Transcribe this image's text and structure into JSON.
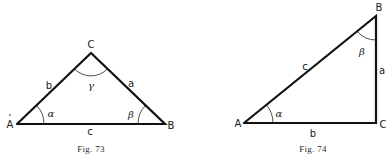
{
  "figures": [
    {
      "caption": "Fig. 73",
      "type": "oblique-triangle",
      "vertices": {
        "A": "A",
        "B": "B",
        "C": "C"
      },
      "sides": {
        "a": "a",
        "b": "b",
        "c": "c"
      },
      "angles": {
        "alpha": "α",
        "beta": "β",
        "gamma": "γ"
      }
    },
    {
      "caption": "Fig. 74",
      "type": "right-triangle",
      "vertices": {
        "A": "A",
        "B": "B",
        "C": "C"
      },
      "sides": {
        "a": "a",
        "b": "b",
        "c": "c"
      },
      "angles": {
        "alpha": "α",
        "beta": "β"
      }
    }
  ],
  "colors": {
    "stroke": "#111111",
    "background": "#ffffff"
  }
}
